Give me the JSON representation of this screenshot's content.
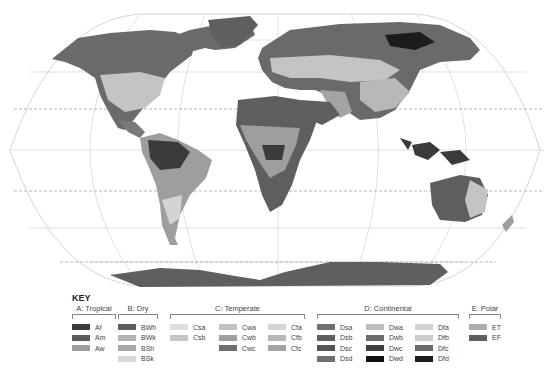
{
  "map": {
    "projection": "robinson",
    "land_shades": {
      "dry_hot": "#5a5a5a",
      "tropical_rain": "#3a3a3a",
      "savanna": "#9a9a9a",
      "temperate": "#c4c4c4",
      "continental": "#6a6a6a",
      "polar": "#5f5f5f",
      "ocean": "#ffffff",
      "graticule": "#cfcfcf"
    }
  },
  "key": {
    "title": "KEY",
    "groups": [
      {
        "title": "A: Tropical",
        "columns": [
          [
            {
              "code": "Af",
              "color": "#3b3b3b"
            },
            {
              "code": "Am",
              "color": "#5c5c5c"
            },
            {
              "code": "Aw",
              "color": "#9e9e9e"
            }
          ]
        ]
      },
      {
        "title": "B: Dry",
        "columns": [
          [
            {
              "code": "BWh",
              "color": "#5e5e5e"
            },
            {
              "code": "BWk",
              "color": "#b3b3b3"
            },
            {
              "code": "BSh",
              "color": "#a8a8a8"
            },
            {
              "code": "BSk",
              "color": "#d9d9d9"
            }
          ]
        ]
      },
      {
        "title": "C: Temperate",
        "columns": [
          [
            {
              "code": "Csa",
              "color": "#dedede"
            },
            {
              "code": "Csb",
              "color": "#c6c6c6"
            }
          ],
          [
            {
              "code": "Cwa",
              "color": "#c2c2c2"
            },
            {
              "code": "Cwb",
              "color": "#a0a0a0"
            },
            {
              "code": "Cwc",
              "color": "#6f6f6f"
            }
          ],
          [
            {
              "code": "Cfa",
              "color": "#d4d4d4"
            },
            {
              "code": "Cfb",
              "color": "#b8b8b8"
            },
            {
              "code": "Cfc",
              "color": "#a4a4a4"
            }
          ]
        ]
      },
      {
        "title": "D: Continental",
        "columns": [
          [
            {
              "code": "Dsa",
              "color": "#707070"
            },
            {
              "code": "Dsb",
              "color": "#5e5e5e"
            },
            {
              "code": "Dsc",
              "color": "#555555"
            },
            {
              "code": "Dsd",
              "color": "#707070"
            }
          ],
          [
            {
              "code": "Dwa",
              "color": "#bdbdbd"
            },
            {
              "code": "Dwb",
              "color": "#6c6c6c"
            },
            {
              "code": "Dwc",
              "color": "#3f3f3f"
            },
            {
              "code": "Dwd",
              "color": "#111111"
            }
          ],
          [
            {
              "code": "Dfa",
              "color": "#d3d3d3"
            },
            {
              "code": "Dfb",
              "color": "#cbcbcb"
            },
            {
              "code": "Dfc",
              "color": "#6a6a6a"
            },
            {
              "code": "Dfd",
              "color": "#1c1c1c"
            }
          ]
        ]
      },
      {
        "title": "E: Polar",
        "columns": [
          [
            {
              "code": "ET",
              "color": "#acacac"
            },
            {
              "code": "EF",
              "color": "#5f5f5f"
            }
          ]
        ]
      }
    ]
  }
}
